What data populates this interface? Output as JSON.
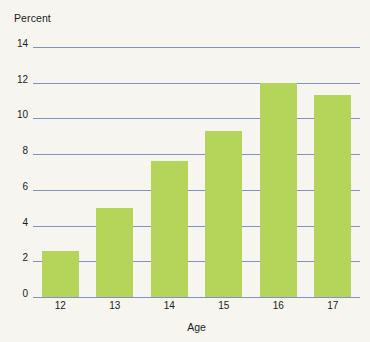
{
  "chart_data": {
    "type": "bar",
    "title": "",
    "subtitle": "",
    "xlabel": "Age",
    "ylabel": "Percent",
    "categories": [
      "12",
      "13",
      "14",
      "15",
      "16",
      "17"
    ],
    "values": [
      2.6,
      5.0,
      7.6,
      9.3,
      12.0,
      11.3
    ],
    "ylim": [
      0,
      14
    ],
    "yticks": [
      0,
      2,
      4,
      6,
      8,
      10,
      12,
      14
    ],
    "ytick_labels": [
      "0",
      "2",
      "4",
      "6",
      "8",
      "10",
      "12",
      "14"
    ],
    "grid": true,
    "legend": false,
    "legend_position": "none",
    "colors": {
      "bar": "#b5d45a",
      "gridline": "#8193c2",
      "text": "#1b1b1b",
      "background": "#f6f5f0"
    }
  }
}
